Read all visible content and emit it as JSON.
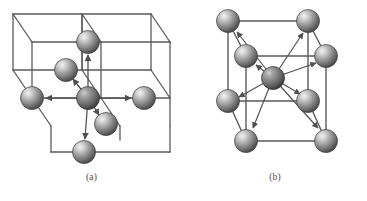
{
  "figure": {
    "background_color": "#ffffff",
    "line_color": "#555555",
    "arrow_color": "#555555",
    "sphere_base_color": "#8f8f8f",
    "sphere_highlight_color": "#e8e8e8",
    "sphere_shadow_color": "#4a4a4a",
    "caption_color": "#4a4a4a"
  },
  "panels": [
    {
      "id": "a",
      "caption": "(a)",
      "structure_type": "simple-cubic",
      "coordination_number": 6,
      "description": "Simple cubic lattice shown as two adjacent wireframe cubes with a central atom and six arrows to its nearest neighbours",
      "cube_count": 2,
      "atoms": [
        {
          "name": "center-atom",
          "cx": 88,
          "cy": 98,
          "r": 11.5
        },
        {
          "name": "neighbor-left-atom",
          "cx": 32,
          "cy": 98,
          "r": 11.5
        },
        {
          "name": "neighbor-right-atom",
          "cx": 144,
          "cy": 98,
          "r": 11.5
        },
        {
          "name": "neighbor-top-atom",
          "cx": 88,
          "cy": 42,
          "r": 11.5
        },
        {
          "name": "neighbor-bottom-atom",
          "cx": 84,
          "cy": 152,
          "r": 11.5
        },
        {
          "name": "neighbor-back-atom",
          "cx": 66,
          "cy": 70,
          "r": 11.5
        },
        {
          "name": "neighbor-front-atom",
          "cx": 106,
          "cy": 124,
          "r": 11.5
        }
      ],
      "arrows": [
        {
          "name": "arrow-to-left",
          "x1": 88,
          "y1": 98,
          "x2": 46,
          "y2": 98
        },
        {
          "name": "arrow-to-right",
          "x1": 88,
          "y1": 98,
          "x2": 131,
          "y2": 98
        },
        {
          "name": "arrow-to-top",
          "x1": 88,
          "y1": 98,
          "x2": 88,
          "y2": 55
        },
        {
          "name": "arrow-to-bottom",
          "x1": 88,
          "y1": 98,
          "x2": 85,
          "y2": 139
        },
        {
          "name": "arrow-to-back",
          "x1": 88,
          "y1": 98,
          "x2": 73,
          "y2": 79
        },
        {
          "name": "arrow-to-front",
          "x1": 88,
          "y1": 98,
          "x2": 99,
          "y2": 115
        }
      ]
    },
    {
      "id": "b",
      "caption": "(b)",
      "structure_type": "body-centred-cubic",
      "coordination_number": 8,
      "description": "Body-centred cubic cell with eight corner atoms and a body-centre atom with eight arrows to the corner atoms",
      "cube_count": 1,
      "atoms": [
        {
          "name": "body-center-atom",
          "cx": 90,
          "cy": 78,
          "r": 11.5
        },
        {
          "name": "corner-back-top-left-atom",
          "cx": 45,
          "cy": 21,
          "r": 11.5
        },
        {
          "name": "corner-back-top-right-atom",
          "cx": 125,
          "cy": 21,
          "r": 11.5
        },
        {
          "name": "corner-front-top-left-atom",
          "cx": 63,
          "cy": 56,
          "r": 11.5
        },
        {
          "name": "corner-front-top-right-atom",
          "cx": 143,
          "cy": 56,
          "r": 11.5
        },
        {
          "name": "corner-back-bottom-left-atom",
          "cx": 45,
          "cy": 101,
          "r": 11.5
        },
        {
          "name": "corner-back-bottom-right-atom",
          "cx": 125,
          "cy": 101,
          "r": 11.5
        },
        {
          "name": "corner-front-bottom-left-atom",
          "cx": 63,
          "cy": 141,
          "r": 11.5
        },
        {
          "name": "corner-front-bottom-right-atom",
          "cx": 143,
          "cy": 141,
          "r": 11.5
        }
      ],
      "arrows": [
        {
          "name": "arrow-to-back-top-left",
          "x1": 90,
          "y1": 78,
          "x2": 54,
          "y2": 32
        },
        {
          "name": "arrow-to-back-top-right",
          "x1": 90,
          "y1": 78,
          "x2": 120,
          "y2": 33
        },
        {
          "name": "arrow-to-front-top-left",
          "x1": 90,
          "y1": 78,
          "x2": 73,
          "y2": 65
        },
        {
          "name": "arrow-to-front-top-right",
          "x1": 90,
          "y1": 78,
          "x2": 133,
          "y2": 63
        },
        {
          "name": "arrow-to-back-bottom-left",
          "x1": 90,
          "y1": 78,
          "x2": 56,
          "y2": 97
        },
        {
          "name": "arrow-to-back-bottom-right",
          "x1": 90,
          "y1": 78,
          "x2": 117,
          "y2": 94
        },
        {
          "name": "arrow-to-front-bottom-left",
          "x1": 90,
          "y1": 78,
          "x2": 70,
          "y2": 128
        },
        {
          "name": "arrow-to-front-bottom-right",
          "x1": 90,
          "y1": 78,
          "x2": 135,
          "y2": 128
        }
      ]
    }
  ]
}
